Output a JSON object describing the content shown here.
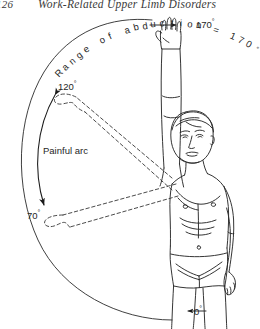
{
  "page": {
    "folio": "126",
    "running_title": "Work-Related Upper Limb Disorders",
    "background_color": "#ffffff",
    "ink_color": "#1a1a1a"
  },
  "figure": {
    "name": "shoulder-abduction-painful-arc-diagram",
    "labels": {
      "range_of_abduction": "Range of abduction = 170",
      "range_of_abduction_degree": "°",
      "painful_arc": "Painful arc",
      "angle_170": "170",
      "angle_120": "120",
      "angle_70": "70",
      "angle_0": "0",
      "degree_symbol": "°"
    },
    "arc": {
      "outer_arc_start_deg": 0,
      "outer_arc_end_deg": 170,
      "painful_arc_start_deg": 70,
      "painful_arc_end_deg": 120,
      "pivot_label": "shoulder-joint-centre"
    },
    "arm_positions": [
      {
        "name": "arm-at-170-degrees",
        "style": "solid",
        "angle": 170
      },
      {
        "name": "arm-at-120-degrees",
        "style": "dashed",
        "angle": 120
      },
      {
        "name": "arm-at-70-degrees",
        "style": "dashed",
        "angle": 70
      },
      {
        "name": "arm-at-0-degrees",
        "style": "solid",
        "angle": 0
      }
    ]
  }
}
